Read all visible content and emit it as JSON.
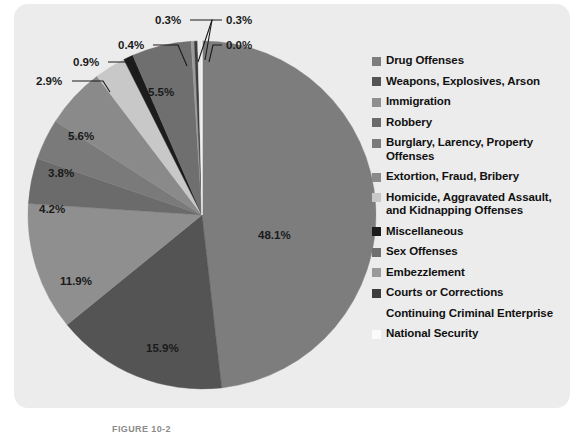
{
  "figure": {
    "caption": "FIGURE 10-2",
    "panel_color": "#ececec",
    "page_background": "#ffffff"
  },
  "chart_data": {
    "type": "pie",
    "title": "",
    "legend_position": "right",
    "grid": false,
    "start_angle_deg": -90,
    "direction": "clockwise",
    "categories": [
      "Drug Offenses",
      "Weapons, Explosives, Arson",
      "Immigration",
      "Robbery",
      "Burglary, Larency, Property Offenses",
      "Extortion, Fraud, Bribery",
      "Homicide, Aggravated Assault, and Kidnapping Offenses",
      "Miscellaneous",
      "Sex Offenses",
      "Embezzlement",
      "Courts or Corrections",
      "Continuing Criminal Enterprise",
      "National Security"
    ],
    "values": [
      48.1,
      15.9,
      11.9,
      4.2,
      3.8,
      5.6,
      2.9,
      0.9,
      5.5,
      0.3,
      0.3,
      0.4,
      0.0
    ],
    "value_labels": [
      "48.1%",
      "15.9%",
      "11.9%",
      "4.2%",
      "3.8%",
      "5.6%",
      "2.9%",
      "0.9%",
      "5.5%",
      "0.3%",
      "0.3%",
      "0.4%",
      "0.0%"
    ],
    "colors": [
      "#7d7d7d",
      "#545454",
      "#8f8f8f",
      "#6b6b6b",
      "#7a7a7a",
      "#8a8a8a",
      "#c8c8c8",
      "#1c1c1c",
      "#6f6f6f",
      "#9a9a9a",
      "#3d3d3d",
      "#e8e8e8",
      "#fbfbfb"
    ],
    "xlabel": "",
    "ylabel": ""
  },
  "legend": {
    "items": [
      {
        "label": "Drug Offenses",
        "color": "#7d7d7d"
      },
      {
        "label": "Weapons, Explosives, Arson",
        "color": "#545454"
      },
      {
        "label": "Immigration",
        "color": "#8f8f8f"
      },
      {
        "label": "Robbery",
        "color": "#6b6b6b"
      },
      {
        "label": "Burglary, Larency, Property Offenses",
        "color": "#7a7a7a"
      },
      {
        "label": "Extortion, Fraud, Bribery",
        "color": "#8a8a8a"
      },
      {
        "label": "Homicide, Aggravated Assault, and Kidnapping Offenses",
        "color": "#c8c8c8"
      },
      {
        "label": "Miscellaneous",
        "color": "#1c1c1c"
      },
      {
        "label": "Sex Offenses",
        "color": "#6f6f6f"
      },
      {
        "label": "Embezzlement",
        "color": "#9a9a9a"
      },
      {
        "label": "Courts or Corrections",
        "color": "#3d3d3d"
      },
      {
        "label": "Continuing Criminal Enterprise",
        "color": "#ececec"
      },
      {
        "label": "National Security",
        "color": "#fbfbfb"
      }
    ]
  },
  "pie_labels": {
    "inside": [
      {
        "text": "48.1%",
        "x": 258,
        "y": 239
      },
      {
        "text": "15.9%",
        "x": 146,
        "y": 352
      },
      {
        "text": "11.9%",
        "x": 60,
        "y": 285
      },
      {
        "text": "4.2%",
        "x": 39,
        "y": 213
      },
      {
        "text": "3.8%",
        "x": 48,
        "y": 177
      },
      {
        "text": "5.6%",
        "x": 68,
        "y": 140
      },
      {
        "text": "5.5%",
        "x": 148,
        "y": 96
      }
    ],
    "callouts": [
      {
        "text": "2.9%",
        "tx": 36,
        "ty": 85,
        "lx1": 72,
        "ly1": 81,
        "lx2": 103,
        "ly2": 81,
        "lx3": 110,
        "ly3": 92
      },
      {
        "text": "0.9%",
        "tx": 73,
        "ty": 66,
        "lx1": 108,
        "ly1": 62,
        "lx2": 132,
        "ly2": 62,
        "lx3": 139,
        "ly3": 78
      },
      {
        "text": "0.4%",
        "tx": 118,
        "ty": 49,
        "lx1": 153,
        "ly1": 45,
        "lx2": 178,
        "ly2": 45,
        "lx3": 187,
        "ly3": 66
      },
      {
        "text": "0.3%",
        "tx": 155,
        "ty": 24,
        "lx1": 190,
        "ly1": 20,
        "lx2": 212,
        "ly2": 20,
        "lx3": 198,
        "ly3": 62
      },
      {
        "text": "0.3%",
        "tx": 226,
        "ty": 24,
        "lx1": 222,
        "ly1": 20,
        "lx2": 212,
        "ly2": 20,
        "lx3": 205,
        "ly3": 60
      },
      {
        "text": "0.0%",
        "tx": 226,
        "ty": 49,
        "lx1": 222,
        "ly1": 45,
        "lx2": 213,
        "ly2": 45,
        "lx3": 209,
        "ly3": 62
      }
    ]
  }
}
